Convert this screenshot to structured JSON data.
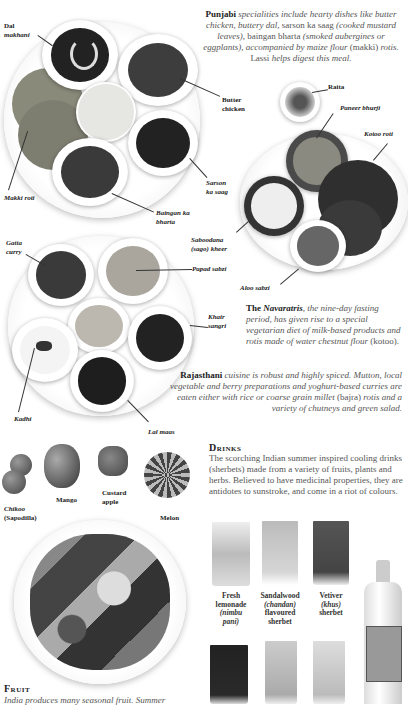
{
  "punjabi": {
    "lead": "Punjabi",
    "text_1": " specialities include hearty dishes like butter chicken, buttery dal, ",
    "text_2": "sarson ka saag",
    "text_3": " (cooked mustard leaves), ",
    "text_4": "baingan bharta",
    "text_5": " (smoked aubergines or eggplants), accompanied by maize flour ",
    "text_6": "(makki)",
    "text_7": " rotis. ",
    "text_8": "Lassi",
    "text_9": " helps digest this meal.",
    "labels": {
      "dal_1": "Dal",
      "dal_2": "makhani",
      "butter_1": "Butter",
      "butter_2": "chicken",
      "sarson_1": "Sarson",
      "sarson_2": "ka saag",
      "makki": "Makki roti",
      "baingan_1": "Baingan ka",
      "baingan_2": "bharta"
    }
  },
  "navaratri": {
    "lead": "The ",
    "lead_em": "Navaratris",
    "text_1": ", the nine-day fasting period, has given rise to a special vegetarian diet of milk-based products and rotis made of water chestnut flour ",
    "text_2": "(kotoo).",
    "labels": {
      "raita": "Raita",
      "paneer": "Paneer bhurji",
      "kotoo": "Kotoo roti",
      "saboodana_1": "Saboodana",
      "saboodana_2": "(sago) kheer",
      "aloo": "Aloo sabzi"
    }
  },
  "rajasthani": {
    "lead": "Rajasthani",
    "text_1": " cuisine is robust and highly spiced. Mutton, local vegetable and berry preparations and yoghurt-based curries are eaten either with rice or coarse grain millet ",
    "text_2": "(bajra)",
    "text_3": " rotis and a variety of chutneys and green salad.",
    "labels": {
      "gatta_1": "Gatta",
      "gatta_2": "curry",
      "papad": "Papad sabzi",
      "khair_1": "Khair",
      "khair_2": "sangri",
      "kadhi": "Kadhi",
      "lal": "Lal maas"
    }
  },
  "fruit_labels": {
    "chikoo_1": "Chikoo",
    "chikoo_2": "(Sapodilla)",
    "mango": "Mango",
    "custard_1": "Custard",
    "custard_2": "apple",
    "melon": "Melon"
  },
  "drinks": {
    "heading": "Drinks",
    "text": "The scorching Indian summer inspired cooling drinks (sherbets) made from a variety of fruits, plants and herbs. Believed to have medicinal properties, they are antidotes to sunstroke, and come in a riot of colours.",
    "items": [
      {
        "l1": "Fresh",
        "l2": "lemonade",
        "l3": "(nimbu",
        "l4": "pani)"
      },
      {
        "l1": "Sandalwood",
        "l2": "(chandan)",
        "l3": "flavoured",
        "l4": "sherbet"
      },
      {
        "l1": "Vetiver",
        "l2": "(khus)",
        "l3": "sherbet",
        "l4": ""
      }
    ]
  },
  "fruit": {
    "heading": "Fruit",
    "text": "India produces many seasonal fruit. Summer"
  }
}
